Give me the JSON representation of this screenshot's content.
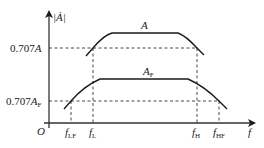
{
  "diagram": {
    "colors": {
      "ink": "#1a1a1a",
      "axis": "#333333",
      "dash": "#333333"
    },
    "axes": {
      "y_label": "|Ȧ|",
      "x_label": "f",
      "origin": "O"
    },
    "curves": [
      {
        "id": "A",
        "label": "A",
        "lower_cutoff": "f_L",
        "upper_cutoff": "f_H"
      },
      {
        "id": "AF",
        "label": "A",
        "label_sub": "F",
        "lower_cutoff": "f_LF",
        "upper_cutoff": "f_HF"
      }
    ],
    "levels": [
      {
        "label": "0.707A",
        "main": "0.707",
        "var": "A",
        "sub": ""
      },
      {
        "label": "0.707A_F",
        "main": "0.707",
        "var": "A",
        "sub": "F"
      }
    ],
    "x_ticks": [
      {
        "main": "f",
        "sub": "LF"
      },
      {
        "main": "f",
        "sub": "L"
      },
      {
        "main": "f",
        "sub": "H"
      },
      {
        "main": "f",
        "sub": "HF"
      }
    ]
  }
}
